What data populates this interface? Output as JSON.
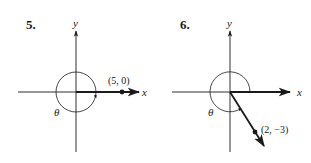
{
  "figures": [
    {
      "number": "5.",
      "x_axis_label": "x",
      "y_axis_label": "y",
      "angle_label": "θ",
      "point_label": "(5, 0)",
      "point": [
        5,
        0
      ]
    },
    {
      "number": "6.",
      "x_axis_label": "x",
      "y_axis_label": "y",
      "angle_label": "θ",
      "point_label": "(2, −3)",
      "point": [
        2,
        -3
      ]
    }
  ],
  "colors": {
    "ink": "#1a1a1a",
    "background": "#ffffff"
  }
}
